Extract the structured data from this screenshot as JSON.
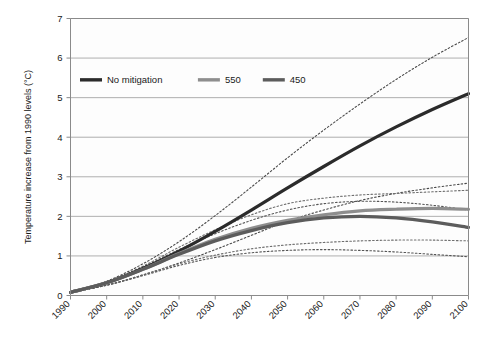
{
  "chart_data": {
    "type": "line",
    "title": "",
    "subtitle": "",
    "xlabel": "",
    "ylabel": "Temperature increase from 1990 levels (°C)",
    "xlim": [
      1990,
      2100
    ],
    "ylim": [
      0,
      7
    ],
    "grid": true,
    "legend_position": "top-left-inside",
    "y_ticks": [
      "0",
      "1",
      "2",
      "3",
      "4",
      "5",
      "6",
      "7"
    ],
    "x_ticks": [
      "1990",
      "2000",
      "2010",
      "2020",
      "2030",
      "2040",
      "2050",
      "2060",
      "2070",
      "2080",
      "2090",
      "2100"
    ],
    "x": [
      1990,
      2000,
      2010,
      2020,
      2030,
      2040,
      2050,
      2060,
      2070,
      2080,
      2090,
      2100
    ],
    "series": [
      {
        "name": "No mitigation",
        "color": "#2b2b2b",
        "style": "solid",
        "width": 3.2,
        "values": [
          0.08,
          0.32,
          0.68,
          1.12,
          1.62,
          2.16,
          2.72,
          3.26,
          3.78,
          4.26,
          4.7,
          5.1
        ]
      },
      {
        "name": "No mitigation upper bound",
        "color": "#4a4a4a",
        "style": "dotted",
        "width": 1.1,
        "values": [
          0.08,
          0.36,
          0.8,
          1.36,
          2.02,
          2.74,
          3.48,
          4.18,
          4.84,
          5.46,
          6.02,
          6.52
        ]
      },
      {
        "name": "No mitigation lower bound",
        "color": "#4a4a4a",
        "style": "dotted",
        "width": 1.1,
        "values": [
          0.08,
          0.26,
          0.52,
          0.82,
          1.16,
          1.52,
          1.88,
          2.16,
          2.4,
          2.58,
          2.72,
          2.84
        ]
      },
      {
        "name": "550",
        "color": "#8e8e8e",
        "style": "solid",
        "width": 3.2,
        "values": [
          0.08,
          0.32,
          0.66,
          1.06,
          1.42,
          1.7,
          1.9,
          2.04,
          2.14,
          2.18,
          2.2,
          2.18
        ]
      },
      {
        "name": "550 upper bound",
        "color": "#6e6e6e",
        "style": "dotted",
        "width": 1.1,
        "values": [
          0.08,
          0.34,
          0.74,
          1.22,
          1.66,
          2.04,
          2.32,
          2.46,
          2.54,
          2.58,
          2.62,
          2.66
        ]
      },
      {
        "name": "550 lower bound",
        "color": "#6e6e6e",
        "style": "dotted",
        "width": 1.1,
        "values": [
          0.08,
          0.26,
          0.52,
          0.8,
          1.02,
          1.18,
          1.28,
          1.34,
          1.38,
          1.4,
          1.4,
          1.38
        ]
      },
      {
        "name": "450",
        "color": "#5c5c5c",
        "style": "solid",
        "width": 3.2,
        "values": [
          0.08,
          0.32,
          0.66,
          1.04,
          1.38,
          1.64,
          1.84,
          1.96,
          2.0,
          1.96,
          1.86,
          1.72
        ]
      },
      {
        "name": "450 upper bound",
        "color": "#555555",
        "style": "dotted",
        "width": 1.1,
        "values": [
          0.08,
          0.34,
          0.72,
          1.16,
          1.56,
          1.9,
          2.16,
          2.32,
          2.38,
          2.36,
          2.28,
          2.16
        ]
      },
      {
        "name": "450 lower bound",
        "color": "#555555",
        "style": "dotted",
        "width": 1.1,
        "values": [
          0.08,
          0.26,
          0.5,
          0.76,
          0.96,
          1.08,
          1.14,
          1.16,
          1.14,
          1.1,
          1.04,
          0.98
        ]
      }
    ],
    "legend": [
      {
        "label": "No mitigation",
        "color": "#2b2b2b"
      },
      {
        "label": "550",
        "color": "#8e8e8e"
      },
      {
        "label": "450",
        "color": "#5c5c5c"
      }
    ]
  }
}
